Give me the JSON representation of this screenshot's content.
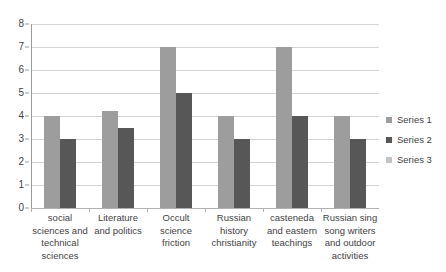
{
  "chart_data": {
    "type": "bar",
    "title": "",
    "xlabel": "",
    "ylabel": "",
    "ylim": [
      0,
      8
    ],
    "y_ticks": [
      0,
      1,
      2,
      3,
      4,
      5,
      6,
      7,
      8
    ],
    "grid": true,
    "legend_position": "right",
    "categories": [
      "social sciences and technical sciences",
      "Literature and politics",
      "Occult science friction",
      "Russian history christianity",
      "casteneda and eastern teachings",
      "Russian sing song writers and outdoor activities"
    ],
    "series": [
      {
        "name": "Series 1",
        "color": "#9d9d9d",
        "values": [
          4,
          4.2,
          7,
          4,
          7,
          4
        ]
      },
      {
        "name": "Series 2",
        "color": "#575757",
        "values": [
          3,
          3.5,
          5,
          3,
          4,
          3
        ]
      },
      {
        "name": "Series 3",
        "color": "#c3c3c3",
        "values": [
          0,
          0,
          0,
          0,
          0,
          0
        ]
      }
    ]
  },
  "legend": {
    "items": [
      {
        "label": "Series 1"
      },
      {
        "label": "Series 2"
      },
      {
        "label": "Series 3"
      }
    ]
  }
}
